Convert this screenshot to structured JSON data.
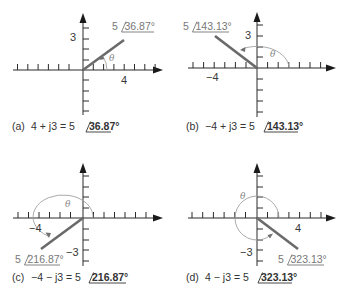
{
  "figure": {
    "panels": [
      {
        "id": "a",
        "caption_prefix": "(a)",
        "caption_expr": "4 + j3 = 5",
        "caption_angle": "36.87°",
        "vector_label_mag": "5",
        "vector_label_angle": "36.87°",
        "x_label": "4",
        "y_label": "3",
        "theta": "θ",
        "real": 4,
        "imag": 3,
        "magnitude": 5,
        "angle_deg": 36.87
      },
      {
        "id": "b",
        "caption_prefix": "(b)",
        "caption_expr": "−4 + j3 = 5",
        "caption_angle": "143.13°",
        "vector_label_mag": "5",
        "vector_label_angle": "143.13°",
        "x_label": "−4",
        "y_label": "3",
        "theta": "θ",
        "real": -4,
        "imag": 3,
        "magnitude": 5,
        "angle_deg": 143.13
      },
      {
        "id": "c",
        "caption_prefix": "(c)",
        "caption_expr": "−4 − j3 = 5",
        "caption_angle": "216.87°",
        "vector_label_mag": "5",
        "vector_label_angle": "216.87°",
        "x_label": "−4",
        "y_label": "−3",
        "theta": "θ",
        "real": -4,
        "imag": -3,
        "magnitude": 5,
        "angle_deg": 216.87
      },
      {
        "id": "d",
        "caption_prefix": "(d)",
        "caption_expr": "4 − j3 = 5",
        "caption_angle": "323.13°",
        "vector_label_mag": "5",
        "vector_label_angle": "323.13°",
        "x_label": "4",
        "y_label": "−3",
        "theta": "θ",
        "real": 4,
        "imag": -3,
        "magnitude": 5,
        "angle_deg": 323.13
      }
    ],
    "colors": {
      "axis": "#2a2a2a",
      "vector": "#6a6a6a",
      "arc": "#a0a0a0",
      "caption": "#333333"
    }
  }
}
